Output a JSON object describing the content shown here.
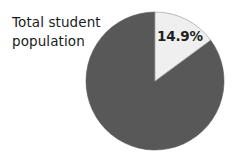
{
  "figure": {
    "background_color": "#ffffff",
    "width": 237,
    "height": 157
  },
  "category_label": "Total student\npopulation",
  "labels": {
    "slice_0": "14.9%"
  },
  "chart_data": {
    "type": "pie",
    "title": "",
    "subtitle": "",
    "xlabel": "",
    "ylabel": "",
    "annotations": [
      "Total student population"
    ],
    "legend": null,
    "legend_position": "none",
    "grid": false,
    "start_angle_deg": 0,
    "direction": "clockwise",
    "center": [
      155,
      81
    ],
    "radius": 69,
    "categories": [
      "Segment",
      "Remainder"
    ],
    "values": [
      14.9,
      85.1
    ],
    "value_unit": "percent",
    "data_labels": [
      "14.9%",
      ""
    ],
    "colors": [
      "#efefef",
      "#585858"
    ],
    "edge_color": "#9a9a9a",
    "text_color": "#1f1f1f"
  }
}
